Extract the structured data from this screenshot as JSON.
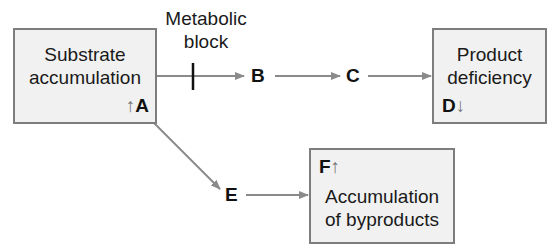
{
  "diagram": {
    "nodes": {
      "substrate": {
        "title_line1": "Substrate",
        "title_line2": "accumulation",
        "marker_label": "A",
        "marker_arrow": "↑"
      },
      "product": {
        "title_line1": "Product",
        "title_line2": "deficiency",
        "marker_label": "D",
        "marker_arrow": "↓"
      },
      "byproducts": {
        "title_line1": "Accumulation",
        "title_line2": "of byproducts",
        "marker_label": "F",
        "marker_arrow": "↑"
      }
    },
    "intermediates": {
      "b": "B",
      "c": "C",
      "e": "E"
    },
    "block_annotation": {
      "line1": "Metabolic",
      "line2": "block"
    },
    "edges": [
      {
        "from": "A",
        "to": "B",
        "blocked": true
      },
      {
        "from": "B",
        "to": "C"
      },
      {
        "from": "C",
        "to": "D"
      },
      {
        "from": "A",
        "to": "E"
      },
      {
        "from": "E",
        "to": "F"
      }
    ],
    "colors": {
      "box_fill": "#f1f1f1",
      "box_border": "#7d7d7d",
      "arrow": "#8a8a8a",
      "block_bar": "#111111"
    }
  }
}
